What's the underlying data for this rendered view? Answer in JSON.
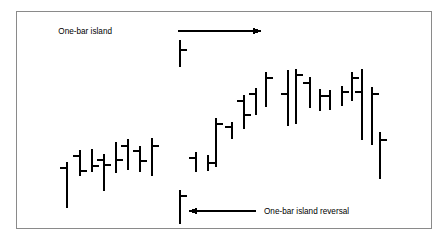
{
  "figure": {
    "name": "one-bar-island-chart",
    "background_color": "#ffffff",
    "frame_color": "#8a8a8a",
    "bar_color": "#000000"
  },
  "annotations": [
    {
      "id": "one-bar-island",
      "label": "One-bar island",
      "text_x": 112,
      "text_y": 34,
      "arrow_from_x": 178,
      "arrow_from_y": 31,
      "arrow_to_x": 262,
      "arrow_to_y": 31,
      "direction": "right"
    },
    {
      "id": "one-bar-island-reversal",
      "label": "One-bar island reversal",
      "text_x": 264,
      "text_y": 214,
      "arrow_from_x": 256,
      "arrow_from_y": 211,
      "arrow_to_x": 188,
      "arrow_to_y": 211,
      "direction": "left"
    }
  ],
  "chart_data": {
    "type": "ohlc",
    "title": "",
    "xlabel": "",
    "ylabel": "",
    "grid": false,
    "legend": null,
    "axis_visible": false,
    "note": "Price bar (OHLC) chart illustrating a one-bar island and a one-bar island reversal. Values are pixel-space coordinates of each bar: x = bar centre, high/low = top/bottom of vertical line, open = left tick y, close = right tick y. Ticks listed as null are absent.",
    "tick_length": 7,
    "bars": [
      {
        "i": 1,
        "x": 67,
        "high": 162,
        "low": 208,
        "open": 168,
        "close": null
      },
      {
        "i": 2,
        "x": 80,
        "high": 150,
        "low": 176,
        "open": 156,
        "close": 171
      },
      {
        "i": 3,
        "x": 92,
        "high": 149,
        "low": 172,
        "open": null,
        "close": 166
      },
      {
        "i": 4,
        "x": 104,
        "high": 154,
        "low": 191,
        "open": 160,
        "close": 165
      },
      {
        "i": 5,
        "x": 116,
        "high": 142,
        "low": 173,
        "open": null,
        "close": 160
      },
      {
        "i": 6,
        "x": 128,
        "high": 139,
        "low": 170,
        "open": 146,
        "close": null
      },
      {
        "i": 7,
        "x": 140,
        "high": 146,
        "low": 172,
        "open": 151,
        "close": 161
      },
      {
        "i": 8,
        "x": 152,
        "high": 138,
        "low": 176,
        "open": null,
        "close": 146
      },
      {
        "i": 9,
        "x": 180,
        "high": 40,
        "low": 67,
        "open": null,
        "close": 50
      },
      {
        "i": 10,
        "x": 180,
        "high": 190,
        "low": 224,
        "open": null,
        "close": 196
      },
      {
        "i": 11,
        "x": 196,
        "high": 152,
        "low": 172,
        "open": 158,
        "close": null
      },
      {
        "i": 12,
        "x": 208,
        "high": 155,
        "low": 171,
        "open": null,
        "close": 163
      },
      {
        "i": 13,
        "x": 216,
        "high": 118,
        "low": 167,
        "open": null,
        "close": 124
      },
      {
        "i": 14,
        "x": 232,
        "high": 122,
        "low": 139,
        "open": 127,
        "close": null
      },
      {
        "i": 15,
        "x": 244,
        "high": 95,
        "low": 129,
        "open": 101,
        "close": 115
      },
      {
        "i": 16,
        "x": 256,
        "high": 88,
        "low": 115,
        "open": 94,
        "close": null
      },
      {
        "i": 17,
        "x": 266,
        "high": 72,
        "low": 107,
        "open": null,
        "close": 78
      },
      {
        "i": 18,
        "x": 288,
        "high": 70,
        "low": 126,
        "open": 94,
        "close": null
      },
      {
        "i": 19,
        "x": 296,
        "high": 69,
        "low": 124,
        "open": null,
        "close": 75
      },
      {
        "i": 20,
        "x": 310,
        "high": 77,
        "low": 108,
        "open": 83,
        "close": null
      },
      {
        "i": 21,
        "x": 320,
        "high": 89,
        "low": 111,
        "open": null,
        "close": 96
      },
      {
        "i": 22,
        "x": 330,
        "high": 90,
        "low": 110,
        "open": 96,
        "close": null
      },
      {
        "i": 23,
        "x": 342,
        "high": 86,
        "low": 106,
        "open": null,
        "close": 92
      },
      {
        "i": 24,
        "x": 352,
        "high": 72,
        "low": 101,
        "open": null,
        "close": 78
      },
      {
        "i": 25,
        "x": 362,
        "high": 69,
        "low": 140,
        "open": 92,
        "close": null
      },
      {
        "i": 26,
        "x": 372,
        "high": 87,
        "low": 145,
        "open": null,
        "close": 94
      },
      {
        "i": 27,
        "x": 380,
        "high": 132,
        "low": 179,
        "open": null,
        "close": 140
      }
    ]
  }
}
